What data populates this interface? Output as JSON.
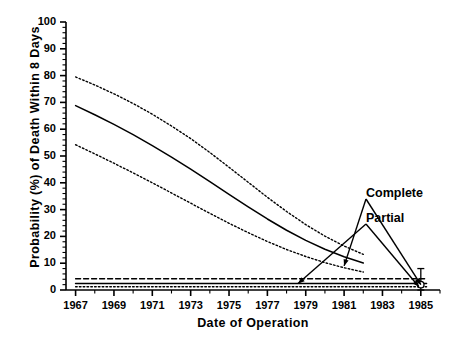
{
  "chart_data": {
    "type": "line",
    "title": "",
    "xlabel": "Date of Operation",
    "ylabel": "Probability (%) of Death Within 8 Days",
    "xlim": [
      1966.5,
      1986.0
    ],
    "ylim": [
      0,
      100
    ],
    "grid": false,
    "legend_position": "none",
    "x_ticks": [
      1967,
      1969,
      1971,
      1973,
      1975,
      1977,
      1979,
      1981,
      1983,
      1985
    ],
    "x_tick_labels": [
      "1967",
      "1969",
      "1971",
      "1973",
      "1975",
      "1977",
      "1979",
      "1981",
      "1983",
      "1985"
    ],
    "x_minor_tick_interval": 1,
    "y_ticks": [
      0,
      10,
      20,
      30,
      40,
      50,
      60,
      70,
      80,
      90,
      100
    ],
    "y_tick_labels": [
      "0",
      "10",
      "20",
      "30",
      "40",
      "50",
      "60",
      "70",
      "80",
      "90",
      "100"
    ],
    "y_minor_tick_interval": 2,
    "series": [
      {
        "name": "Complete upper 95% confidence limit",
        "style": "dotted",
        "x": [
          1967,
          1968,
          1969,
          1970,
          1971,
          1972,
          1973,
          1974,
          1975,
          1976,
          1977,
          1978,
          1979,
          1980,
          1981,
          1982
        ],
        "values": [
          79.5,
          76.5,
          73.2,
          69.6,
          65.6,
          61.2,
          56.5,
          51.3,
          45.8,
          40.2,
          34.6,
          29.3,
          24.4,
          20.1,
          16.4,
          13.3
        ]
      },
      {
        "name": "Complete best estimate",
        "style": "solid",
        "x": [
          1967,
          1968,
          1969,
          1970,
          1971,
          1972,
          1973,
          1974,
          1975,
          1976,
          1977,
          1978,
          1979,
          1980,
          1981,
          1982
        ],
        "values": [
          68.8,
          65.4,
          61.8,
          58.0,
          53.9,
          49.6,
          45.1,
          40.4,
          35.7,
          31.0,
          26.5,
          22.3,
          18.5,
          15.2,
          12.4,
          10.1
        ]
      },
      {
        "name": "Complete lower 95% confidence limit",
        "style": "dotted",
        "x": [
          1967,
          1968,
          1969,
          1970,
          1971,
          1972,
          1973,
          1974,
          1975,
          1976,
          1977,
          1978,
          1979,
          1980,
          1981,
          1982
        ],
        "values": [
          54.2,
          50.8,
          47.3,
          43.7,
          40.0,
          36.2,
          32.4,
          28.6,
          24.9,
          21.4,
          18.1,
          15.1,
          12.5,
          10.2,
          8.3,
          6.7
        ]
      },
      {
        "name": "Partial upper 95% confidence limit",
        "style": "dashed",
        "x": [
          1967,
          1985.3
        ],
        "values": [
          4.2,
          4.2
        ]
      },
      {
        "name": "Partial best estimate",
        "style": "solid",
        "x": [
          1967,
          1985.3
        ],
        "values": [
          2.4,
          2.4
        ]
      },
      {
        "name": "Partial lower 95% confidence limit",
        "style": "dotted",
        "x": [
          1967,
          1985.3
        ],
        "values": [
          1.2,
          1.2
        ]
      }
    ],
    "error_bar": {
      "name": "observed point 1985",
      "x": 1985.0,
      "value": 2.0,
      "low": 0.0,
      "high": 8.0,
      "marker": "open-circle"
    },
    "annotations": [
      {
        "id": "complete",
        "label": "Complete",
        "points_to": [
          [
            1981.0,
            9.0
          ],
          [
            1985.0,
            2.0
          ]
        ]
      },
      {
        "id": "partial",
        "label": "Partial",
        "points_to": [
          [
            1978.6,
            2.4
          ],
          [
            1984.9,
            1.2
          ]
        ]
      }
    ]
  },
  "axis": {
    "x_title": "Date of Operation",
    "y_title": "Probability (%) of  Death Within 8 Days"
  },
  "annotations": {
    "complete_label": "Complete",
    "partial_label": "Partial"
  },
  "colors": {
    "line": "#000000",
    "axis": "#000000",
    "background": "#ffffff"
  }
}
